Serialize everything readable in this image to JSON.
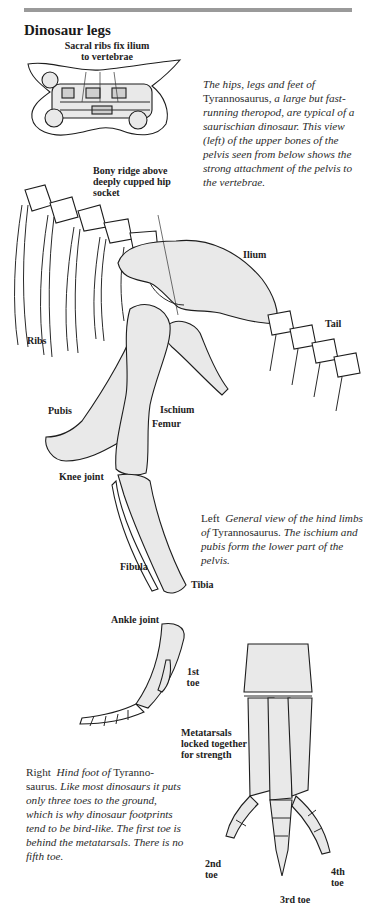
{
  "page": {
    "title": "Dinosaur legs",
    "rule_color": "#9a9a9a"
  },
  "pelvis_top_view": {
    "label": "Sacral ribs fix ilium to vertebrae",
    "label_line1": "Sacral ribs fix ilium",
    "label_line2": "to vertebrae"
  },
  "intro_caption": {
    "lines": [
      "The hips, legs and feet of",
      "Tyrannosaurus, a large but",
      "fast-running theropod, are",
      "typical of a saurischian",
      "dinosaur. This view (left) of",
      "the upper bones of the pelvis",
      "seen from below shows the",
      "strong attachment of the",
      "pelvis to the vertebrae."
    ],
    "part1_italic": "The hips, legs and feet of",
    "part2_roman": "Tyrannosaurus,",
    "part3_italic": "a large but fast-running theropod, are typical of a saurischian dinosaur. This view (left) of the upper bones of the pelvis seen from below shows the strong attachment of the pelvis to the vertebrae."
  },
  "hind_limb_view": {
    "labels": {
      "bony_ridge_line1": "Bony ridge above",
      "bony_ridge_line2": "deeply cupped hip",
      "bony_ridge_line3": "socket",
      "ilium": "Ilium",
      "ribs": "Ribs",
      "tail": "Tail",
      "pubis": "Pubis",
      "ischium": "Ischium",
      "femur": "Femur",
      "knee_joint": "Knee joint",
      "fibula": "Fibula",
      "tibia": "Tibia",
      "ankle_joint": "Ankle joint",
      "first_toe_line1": "1st",
      "first_toe_line2": "toe"
    },
    "caption": {
      "lead": "Left",
      "italic1": "General view of the hind limbs of",
      "roman1": "Tyrannosaurus.",
      "italic2": "The ischium and pubis form the lower part of the pelvis."
    }
  },
  "hind_foot_view": {
    "labels": {
      "metatarsals_line1": "Metatarsals",
      "metatarsals_line2": "locked together",
      "metatarsals_line3": "for strength",
      "second_toe_line1": "2nd",
      "second_toe_line2": "toe",
      "third_toe": "3rd toe",
      "fourth_toe_line1": "4th",
      "fourth_toe_line2": "toe"
    },
    "caption": {
      "lead": "Right",
      "italic1": "Hind foot of",
      "roman1": "Tyranno-saurus.",
      "italic2": "Like most dinosaurs it puts only three toes to the ground, which is why dinosaur footprints tend to be bird-like. The first toe is behind the metatarsals. There is no fifth toe."
    }
  }
}
